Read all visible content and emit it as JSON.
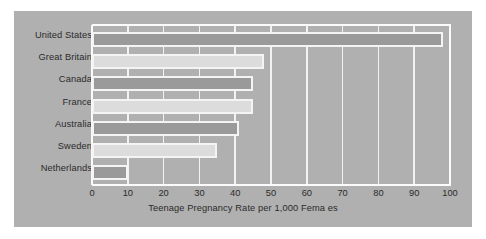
{
  "chart_data": {
    "type": "bar",
    "orientation": "horizontal",
    "title": "",
    "xlabel": "Teenage Pregnancy Rate per 1,000 Fema es",
    "ylabel": "",
    "categories": [
      "United States",
      "Great Britain",
      "Canada",
      "France",
      "Australia",
      "Sweden",
      "Netherlands"
    ],
    "values": [
      98,
      48,
      45,
      45,
      41,
      35,
      10
    ],
    "series": [
      {
        "name": "Teenage Pregnancy Rate per 1,000 Females",
        "values": [
          98,
          48,
          45,
          45,
          41,
          35,
          10
        ]
      }
    ],
    "bar_shades": [
      "dark",
      "light",
      "dark",
      "light",
      "dark",
      "light",
      "dark"
    ],
    "xlim": [
      0,
      100
    ],
    "xticks": [
      0,
      10,
      20,
      30,
      40,
      50,
      60,
      70,
      80,
      90,
      100
    ],
    "xtick_labels": [
      "0",
      "10",
      "20",
      "30",
      "40",
      "50",
      "60",
      "70",
      "80",
      "90",
      "100"
    ],
    "grid": "vertical-white",
    "legend": null,
    "colors": {
      "page_background": "#ffffff",
      "panel_background": "#b0b0b0",
      "gridline": "#f2f2f2",
      "bar_dark": "#9a9a9a",
      "bar_light": "#dcdcdc",
      "bar_border": "#f4f4f4",
      "text": "#2b2b2b"
    }
  }
}
